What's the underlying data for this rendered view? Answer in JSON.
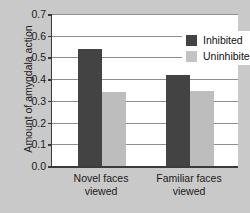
{
  "chart_data": {
    "type": "bar",
    "title": "",
    "xlabel": "",
    "ylabel": "Amount of amygdala action",
    "categories": [
      "Novel faces viewed",
      "Familiar faces viewed"
    ],
    "category_lines": [
      [
        "Novel faces",
        "viewed"
      ],
      [
        "Familiar faces",
        "viewed"
      ]
    ],
    "series": [
      {
        "name": "Inhibited",
        "values": [
          0.54,
          0.42
        ],
        "color": "#434343"
      },
      {
        "name": "Uninhibited",
        "values": [
          0.34,
          0.345
        ],
        "color": "#bdbdbd"
      }
    ],
    "ylim": [
      0.0,
      0.7
    ],
    "ytick_values": [
      0.7,
      0.6,
      0.5,
      0.4,
      0.3,
      0.2,
      0.1,
      0.0
    ],
    "ytick_labels": [
      "0.7",
      "0.6",
      "0.5",
      "0.4",
      "0.3",
      "0.2",
      "0.1",
      "0.0"
    ],
    "grid": true,
    "legend_position": "top-right"
  },
  "figure": {
    "background_color": "#c9c9c9",
    "plot_background_color": "#ffffff",
    "axis_color": "#3a3a3a",
    "grid_color": "#8e8e8e"
  }
}
